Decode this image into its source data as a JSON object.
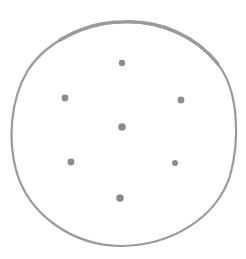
{
  "drawing": {
    "background": "#ffffff",
    "outline": {
      "shape": "hand-drawn-circle",
      "stroke_color": "#9a9a9a",
      "stroke_width": 2.2,
      "thick_stroke_width": 3.4
    },
    "dots": {
      "color": "#8c8c8c",
      "count": 7,
      "items": [
        {
          "name": "top",
          "x": 122,
          "y": 63,
          "r": 3.2
        },
        {
          "name": "upper-left",
          "x": 65,
          "y": 98,
          "r": 3.4
        },
        {
          "name": "upper-right",
          "x": 181,
          "y": 100,
          "r": 3.4
        },
        {
          "name": "center",
          "x": 122,
          "y": 127,
          "r": 3.8
        },
        {
          "name": "lower-left",
          "x": 71,
          "y": 162,
          "r": 3.4
        },
        {
          "name": "lower-right",
          "x": 175,
          "y": 163,
          "r": 3.0
        },
        {
          "name": "bottom",
          "x": 120,
          "y": 198,
          "r": 3.8
        }
      ]
    }
  }
}
